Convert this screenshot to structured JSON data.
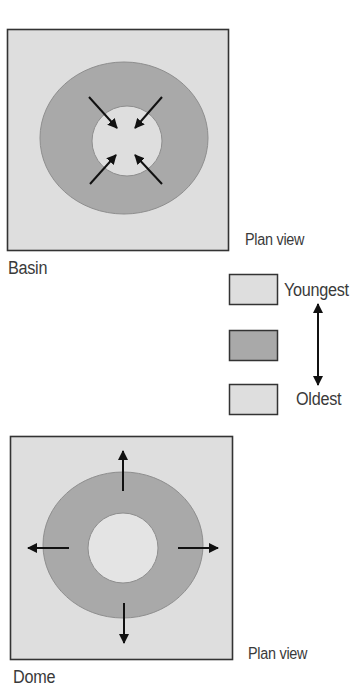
{
  "colors": {
    "background": "#ffffff",
    "box_fill": "#dedede",
    "box_border": "#333333",
    "youngest_fill": "#dedede",
    "middle_fill": "#a9a9a9",
    "oldest_fill": "#dedede",
    "ring_outline": "#8e8e8e",
    "arrow": "#111111",
    "text": "#3a3a3a"
  },
  "basin": {
    "title": "Basin",
    "view_label": "Plan view",
    "arrow_direction": "inward"
  },
  "dome": {
    "title": "Dome",
    "view_label": "Plan view",
    "arrow_direction": "outward"
  },
  "legend": {
    "items": [
      {
        "label": "Youngest",
        "fill": "#dedede"
      },
      {
        "label": "",
        "fill": "#a9a9a9"
      },
      {
        "label": "Oldest",
        "fill": "#dedede"
      }
    ],
    "axis": "double-arrow-vertical"
  }
}
